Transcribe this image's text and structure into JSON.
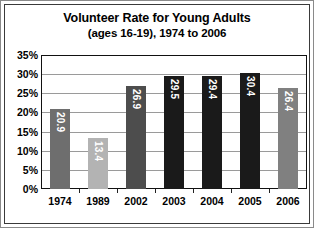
{
  "chart_data": {
    "type": "bar",
    "title": "Volunteer Rate for Young Adults",
    "subtitle": "(ages 16-19), 1974 to 2006",
    "xlabel": "",
    "ylabel": "",
    "categories": [
      "1974",
      "1989",
      "2002",
      "2003",
      "2004",
      "2005",
      "2006"
    ],
    "values": [
      20.9,
      13.4,
      26.9,
      29.5,
      29.4,
      30.4,
      26.4
    ],
    "data_labels": [
      "20.9",
      "13.4",
      "26.9",
      "29.5",
      "29.4",
      "30.4",
      "26.4"
    ],
    "bar_colors": [
      "#6e6e6e",
      "#b3b3b3",
      "#4d4d4d",
      "#1a1a1a",
      "#1a1a1a",
      "#1a1a1a",
      "#808080"
    ],
    "ylim": [
      0,
      35
    ],
    "ytick_values": [
      0,
      5,
      10,
      15,
      20,
      25,
      30,
      35
    ],
    "ytick_labels": [
      "0%",
      "5%",
      "10%",
      "15%",
      "20%",
      "25%",
      "30%",
      "35%"
    ],
    "grid": "horizontal",
    "legend": "none",
    "value_label_color": "#ffffff"
  }
}
